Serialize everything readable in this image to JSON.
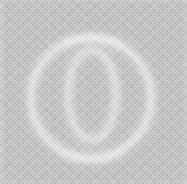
{
  "image": {
    "title": "Two overlapping rings",
    "description": "Soft-focus white outline drawing of two overlapping circles on a flat light-grey dithered field",
    "width_px": 187,
    "height_px": 184,
    "background_color": "#c9c9c9",
    "stroke_color": "#f7f7f7",
    "texture": "checkerboard-dither"
  },
  "figure": {
    "type": "overlapping-circles",
    "blur_px": 3.2,
    "shapes": [
      {
        "id": "large-ring",
        "name": "large-circle",
        "cx": 91,
        "cy": 98,
        "r": 60,
        "stroke_width": 4.6,
        "stroke_color": "#f7f7f7",
        "opacity": 0.95
      },
      {
        "id": "small-ring",
        "name": "small-circle",
        "cx": 92,
        "cy": 95,
        "r": 45,
        "rx": 24,
        "ry": 45,
        "stroke_width": 4.2,
        "stroke_color": "#f4f4f4",
        "opacity": 0.9
      }
    ],
    "intersections": [
      {
        "name": "upper-crossing",
        "x": 92,
        "y": 52
      },
      {
        "name": "lower-crossing",
        "x": 92,
        "y": 139
      }
    ],
    "bounds": {
      "large_left_x": 31,
      "large_right_x": 151,
      "large_top_y": 38,
      "large_bottom_y": 158,
      "small_left_x": 68,
      "small_right_x": 116,
      "small_top_y": 50,
      "small_bottom_y": 140
    }
  }
}
